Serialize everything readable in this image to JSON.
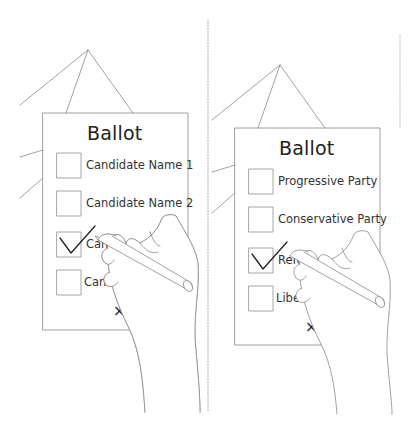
{
  "panels": [
    {
      "id": "left",
      "ballot_title": "Ballot",
      "options": [
        {
          "label": "Candidate Name 1",
          "checked": false
        },
        {
          "label": "Candidate Name 2",
          "checked": false
        },
        {
          "label": "Cand",
          "checked": true
        },
        {
          "label": "Candic",
          "checked": false
        }
      ],
      "mark_glyph": "×"
    },
    {
      "id": "right",
      "ballot_title": "Ballot",
      "options": [
        {
          "label": "Progressive Party",
          "checked": false
        },
        {
          "label": "Conservative Party",
          "checked": false
        },
        {
          "label": "Refo",
          "checked": true
        },
        {
          "label": "Libera",
          "checked": false
        }
      ],
      "mark_glyph": "×"
    }
  ],
  "colors": {
    "line": "#8a8a8a",
    "box": "#8f8f8f",
    "text": "#333333",
    "check": "#222222"
  }
}
